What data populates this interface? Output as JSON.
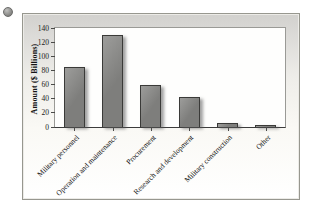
{
  "bullet": {
    "icon": "circle",
    "color": "#8a8a88"
  },
  "chart_data": {
    "type": "bar",
    "title": "",
    "categories": [
      "Military personnel",
      "Operation and maintenance",
      "Procurement",
      "Research and development",
      "Military construction",
      "Other"
    ],
    "values": [
      85,
      130,
      60,
      42,
      6,
      3
    ],
    "xlabel": "",
    "ylabel": "Amount ($ Billions)",
    "ylim": [
      0,
      140
    ],
    "yticks": [
      0,
      20,
      40,
      60,
      80,
      100,
      120,
      140
    ],
    "grid": false,
    "legend": "none",
    "bar_color": "#7e7e7c",
    "bar_highlight_color": "#9d9d9b",
    "bar_border_color": "#3a3a38",
    "axis_color": "#3c3c3c",
    "plot_background": "#fefefd",
    "frame_background_top": "#d2d1ce",
    "frame_background_bottom": "#ffffff"
  }
}
